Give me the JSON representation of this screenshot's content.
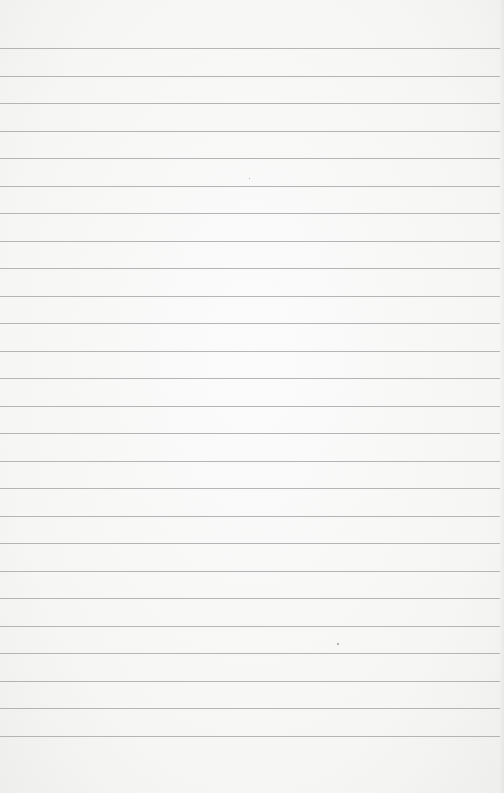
{
  "paper": {
    "type": "lined-notebook-paper",
    "background_color": "#f7f7f6",
    "line_color": "#a9a9a9",
    "line_count": 26,
    "first_line_y": 48,
    "line_spacing": 27.5,
    "text_content": ""
  }
}
